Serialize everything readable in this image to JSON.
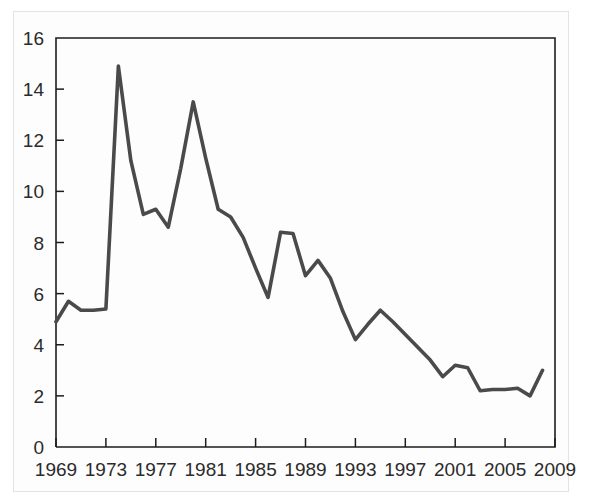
{
  "chart_data": {
    "type": "line",
    "title": "",
    "subtitle": "",
    "xlabel": "",
    "ylabel": "",
    "xlim": [
      1969,
      2009
    ],
    "ylim": [
      0,
      16
    ],
    "grid": false,
    "legend": "none",
    "line_color": "#4a4a4a",
    "axis_color": "#1d1d1d",
    "frame_color": "#e3e3e3",
    "background_color": "#ffffff",
    "y_ticks": [
      "0",
      "2",
      "4",
      "6",
      "8",
      "10",
      "12",
      "14",
      "16"
    ],
    "y_tick_values": [
      0,
      2,
      4,
      6,
      8,
      10,
      12,
      14,
      16
    ],
    "x_ticks": [
      "1969",
      "1973",
      "1977",
      "1981",
      "1985",
      "1989",
      "1993",
      "1997",
      "2001",
      "2005",
      "2009"
    ],
    "x_tick_values": [
      1969,
      1973,
      1977,
      1981,
      1985,
      1989,
      1993,
      1997,
      2001,
      2005,
      2009
    ],
    "x": [
      1969,
      1970,
      1971,
      1972,
      1973,
      1974,
      1975,
      1976,
      1977,
      1978,
      1979,
      1980,
      1981,
      1982,
      1983,
      1984,
      1985,
      1986,
      1987,
      1988,
      1989,
      1990,
      1991,
      1992,
      1993,
      1994,
      1995,
      1996,
      1997,
      1998,
      1999,
      2000,
      2001,
      2002,
      2003,
      2004,
      2005,
      2006,
      2007,
      2008
    ],
    "values": [
      4.9,
      5.7,
      5.35,
      5.35,
      5.4,
      14.9,
      11.2,
      9.1,
      9.3,
      8.6,
      10.9,
      13.5,
      11.3,
      9.3,
      9.0,
      8.2,
      7.0,
      5.85,
      8.4,
      8.35,
      6.7,
      7.3,
      6.6,
      5.3,
      4.2,
      4.8,
      5.35,
      4.9,
      4.4,
      3.9,
      3.4,
      2.75,
      3.2,
      3.1,
      2.2,
      2.25,
      2.25,
      2.3,
      2.0,
      3.0
    ],
    "series": [
      {
        "name": "series-1",
        "values": [
          4.9,
          5.7,
          5.35,
          5.35,
          5.4,
          14.9,
          11.2,
          9.1,
          9.3,
          8.6,
          10.9,
          13.5,
          11.3,
          9.3,
          9.0,
          8.2,
          7.0,
          5.85,
          8.4,
          8.35,
          6.7,
          7.3,
          6.6,
          5.3,
          4.2,
          4.8,
          5.35,
          4.9,
          4.4,
          3.9,
          3.4,
          2.75,
          3.2,
          3.1,
          2.2,
          2.25,
          2.25,
          2.3,
          2.0,
          3.0
        ]
      }
    ],
    "annotations": [],
    "notes": {
      "peak_1": {
        "x": 1974,
        "y": 14.9
      },
      "peak_2": {
        "x": 1980,
        "y": 13.5
      },
      "minimum": {
        "x": 2007,
        "y": 2.0
      },
      "start": {
        "x": 1969,
        "y": 4.9
      },
      "end": {
        "x": 2008,
        "y": 3.0
      }
    }
  }
}
